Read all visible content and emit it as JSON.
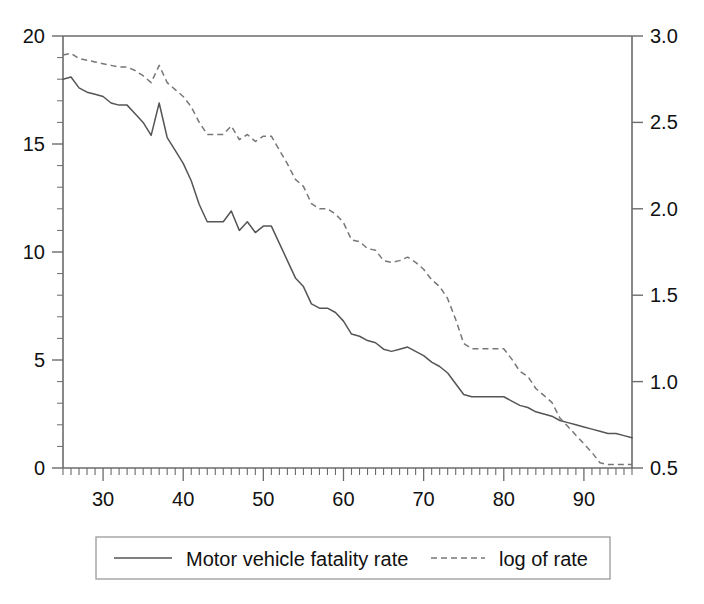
{
  "chart_data": {
    "type": "line",
    "title": "",
    "subtitle": "",
    "xlabel": "",
    "ylabel": "",
    "y2label": "",
    "xlim": [
      25,
      96
    ],
    "ylim": [
      0,
      20
    ],
    "y2lim": [
      0.5,
      3.0
    ],
    "grid": false,
    "legend_position": "below-center",
    "x_ticks": [
      30,
      40,
      50,
      60,
      70,
      80,
      90
    ],
    "x_tick_labels": [
      "30",
      "40",
      "50",
      "60",
      "70",
      "80",
      "90"
    ],
    "x_minor_tick_step": 1,
    "y_ticks": [
      0,
      5,
      10,
      15,
      20
    ],
    "y_tick_labels": [
      "0",
      "5",
      "10",
      "15",
      "20"
    ],
    "y_minor_tick_step": 1,
    "y2_ticks": [
      0.5,
      1.0,
      1.5,
      2.0,
      2.5,
      3.0
    ],
    "y2_tick_labels": [
      "0.5",
      "1.0",
      "1.5",
      "2.0",
      "2.5",
      "3.0"
    ],
    "x": [
      25,
      26,
      27,
      28,
      29,
      30,
      31,
      32,
      33,
      34,
      35,
      36,
      37,
      38,
      39,
      40,
      41,
      42,
      43,
      44,
      45,
      46,
      47,
      48,
      49,
      50,
      51,
      52,
      53,
      54,
      55,
      56,
      57,
      58,
      59,
      60,
      61,
      62,
      63,
      64,
      65,
      66,
      67,
      68,
      69,
      70,
      71,
      72,
      73,
      74,
      75,
      76,
      77,
      78,
      79,
      80,
      81,
      82,
      83,
      84,
      85,
      86,
      87,
      88,
      89,
      90,
      91,
      92,
      93,
      94,
      95,
      96
    ],
    "series": [
      {
        "name": "Motor vehicle fatality rate",
        "axis": "left",
        "style": "solid",
        "color": "#555555",
        "values": [
          18.0,
          18.1,
          17.6,
          17.4,
          17.3,
          17.2,
          16.9,
          16.8,
          16.8,
          16.4,
          16.0,
          15.4,
          16.9,
          15.3,
          14.7,
          14.1,
          13.3,
          12.2,
          11.4,
          11.4,
          11.4,
          11.9,
          11.0,
          11.4,
          10.9,
          11.2,
          11.2,
          10.4,
          9.6,
          8.8,
          8.4,
          7.6,
          7.4,
          7.4,
          7.2,
          6.8,
          6.2,
          6.1,
          5.9,
          5.8,
          5.5,
          5.4,
          5.5,
          5.6,
          5.4,
          5.2,
          4.9,
          4.7,
          4.4,
          3.9,
          3.4,
          3.3,
          3.3,
          3.3,
          3.3,
          3.3,
          3.1,
          2.9,
          2.8,
          2.6,
          2.5,
          2.4,
          2.2,
          2.1,
          2.0,
          1.9,
          1.8,
          1.7,
          1.6,
          1.6,
          1.5,
          1.4
        ]
      },
      {
        "name": "log of rate",
        "axis": "right",
        "style": "dashed",
        "color": "#777777",
        "values": [
          2.89,
          2.9,
          2.87,
          2.86,
          2.85,
          2.84,
          2.83,
          2.82,
          2.82,
          2.8,
          2.77,
          2.73,
          2.83,
          2.73,
          2.69,
          2.65,
          2.59,
          2.5,
          2.43,
          2.43,
          2.43,
          2.48,
          2.4,
          2.43,
          2.39,
          2.42,
          2.42,
          2.34,
          2.26,
          2.17,
          2.13,
          2.03,
          2.0,
          2.0,
          1.97,
          1.92,
          1.82,
          1.81,
          1.77,
          1.76,
          1.7,
          1.69,
          1.7,
          1.72,
          1.69,
          1.65,
          1.59,
          1.55,
          1.48,
          1.36,
          1.22,
          1.19,
          1.19,
          1.19,
          1.19,
          1.19,
          1.13,
          1.06,
          1.03,
          0.96,
          0.92,
          0.88,
          0.79,
          0.74,
          0.69,
          0.64,
          0.59,
          0.53,
          0.52,
          0.52,
          0.52,
          0.52
        ]
      }
    ],
    "legend": [
      {
        "label": "Motor vehicle fatality rate",
        "style": "solid"
      },
      {
        "label": "log of rate",
        "style": "dashed"
      }
    ]
  },
  "colors": {
    "axis": "#6b6b6b",
    "solid_series": "#555555",
    "dashed_series": "#777777",
    "legend_border": "#9a9a9a",
    "text": "#111111",
    "background": "#ffffff"
  }
}
